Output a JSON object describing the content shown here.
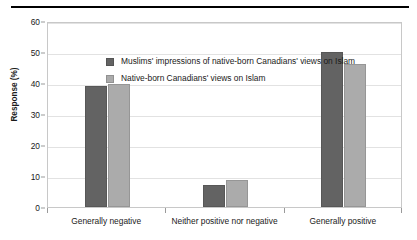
{
  "chart_data": {
    "type": "bar",
    "title": "",
    "xlabel": "",
    "ylabel": "Response (%)",
    "ylim": [
      0,
      60
    ],
    "yticks": [
      0,
      10,
      20,
      30,
      40,
      50,
      60
    ],
    "grid": true,
    "legend_position": "upper-left-inside",
    "categories": [
      "Generally negative",
      "Neither positive nor negative",
      "Generally positive"
    ],
    "series": [
      {
        "name": "Muslims' impressions of native-born Canadians' views on Islam",
        "color": "#636363",
        "values": [
          39,
          7,
          50
        ]
      },
      {
        "name": "Native-born Canadians' views on Islam",
        "color": "#ababab",
        "values": [
          39.7,
          8.6,
          46
        ]
      }
    ]
  },
  "colors": {
    "series_dark": "#636363",
    "series_light": "#ababab",
    "gridline": "#e2e2e2",
    "plot_border": "#c8c8c8",
    "top_rule": "#000000",
    "text": "#1a1a1a"
  }
}
